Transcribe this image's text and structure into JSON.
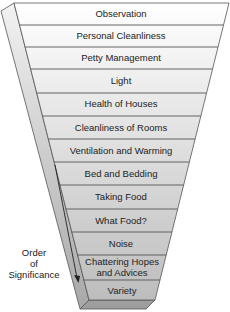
{
  "diagram": {
    "type": "inverted-pyramid",
    "levels": [
      {
        "label": "Observation"
      },
      {
        "label": "Personal Cleanliness"
      },
      {
        "label": "Petty Management"
      },
      {
        "label": "Light"
      },
      {
        "label": "Health of Houses"
      },
      {
        "label": "Cleanliness of Rooms"
      },
      {
        "label": "Ventilation and Warming"
      },
      {
        "label": "Bed and Bedding"
      },
      {
        "label": "Taking Food"
      },
      {
        "label": "What Food?"
      },
      {
        "label": "Noise"
      },
      {
        "label": "Chattering Hopes",
        "label2": "and Advices"
      },
      {
        "label": "Variety"
      }
    ],
    "axis_label": {
      "line1": "Order",
      "line2": "of",
      "line3": "Significance"
    },
    "colors": {
      "top_fill": "#ffffff",
      "bottom_fill": "#c8c8c8",
      "side_fill": "#d9d9d9",
      "line": "#555555",
      "text": "#222222"
    }
  }
}
